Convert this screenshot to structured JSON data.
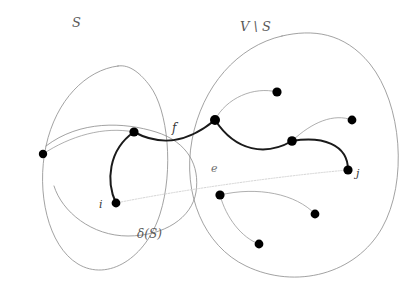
{
  "figure": {
    "background_color": "#ffffff",
    "width": 415,
    "height": 286
  },
  "labels": {
    "set_s": "S",
    "set_v_minus_s": "V \\ S",
    "edge_f": "f",
    "edge_e": "e",
    "node_i": "i",
    "node_j": "j",
    "cut_delta_s": "δ(S)"
  },
  "colors": {
    "blob_outline": "#8a8a8a",
    "thin_edge": "#9a9a9a",
    "faint_edge": "#cfcfcf",
    "thick_path": "#1a1a1a",
    "node_fill": "#000000",
    "label_text": "#5a5a5a"
  },
  "chart_data": {
    "type": "diagram",
    "regions": [
      {
        "name": "S",
        "label": "S",
        "label_pos": [
          78,
          23
        ],
        "path": "M 118 66 C 86 70 56 100 46 146 C 36 192 48 246 78 264 C 108 282 146 258 160 214 C 174 170 168 110 150 86 C 141 74 130 64 118 66 Z"
      },
      {
        "name": "V_minus_S",
        "label": "V \\ S",
        "label_pos": [
          263,
          27
        ],
        "path": "M 282 36 C 238 46 202 86 192 140 C 182 194 204 246 246 266 C 296 290 356 274 382 228 C 408 182 402 104 370 64 C 344 32 312 29 282 36 Z"
      },
      {
        "name": "delta_S_inner_left",
        "label": "δ(S)",
        "label_pos": [
          158,
          236
        ],
        "path": "M 46 146 C 80 120 124 122 156 132 C 188 142 200 166 196 192 C 192 218 164 236 128 236 C 92 236 62 212 54 186"
      }
    ],
    "nodes": [
      {
        "id": "n1",
        "x": 43,
        "y": 154,
        "r": 4.2,
        "label": null,
        "side": "S"
      },
      {
        "id": "n2",
        "x": 134,
        "y": 132,
        "r": 4.6,
        "label": null,
        "side": "S"
      },
      {
        "id": "i",
        "x": 116,
        "y": 203,
        "r": 4.4,
        "label": "i",
        "side": "S"
      },
      {
        "id": "n4",
        "x": 215,
        "y": 120,
        "r": 5.0,
        "label": null,
        "side": "V\\S"
      },
      {
        "id": "n5",
        "x": 277,
        "y": 92,
        "r": 4.6,
        "label": null,
        "side": "V\\S"
      },
      {
        "id": "n6",
        "x": 292,
        "y": 141,
        "r": 4.8,
        "label": null,
        "side": "V\\S"
      },
      {
        "id": "n7",
        "x": 352,
        "y": 120,
        "r": 4.4,
        "label": null,
        "side": "V\\S"
      },
      {
        "id": "j",
        "x": 348,
        "y": 170,
        "r": 4.6,
        "label": "j",
        "side": "V\\S"
      },
      {
        "id": "n9",
        "x": 220,
        "y": 195,
        "r": 4.6,
        "label": null,
        "side": "V\\S"
      },
      {
        "id": "n10",
        "x": 315,
        "y": 214,
        "r": 4.4,
        "label": null,
        "side": "V\\S"
      },
      {
        "id": "n11",
        "x": 259,
        "y": 244,
        "r": 4.4,
        "label": null,
        "side": "V\\S"
      }
    ],
    "edges": [
      {
        "id": "e_thick_i_n2",
        "from": "i",
        "to": "n2",
        "style": "thick",
        "label": null,
        "path": "M 116 203 C 106 182 108 150 134 132"
      },
      {
        "id": "e_thick_f",
        "from": "n2",
        "to": "n4",
        "style": "thick",
        "label": "f",
        "label_pos": [
          176,
          130
        ],
        "path": "M 134 132 C 160 146 186 144 215 120"
      },
      {
        "id": "e_thick_n4_n6",
        "from": "n4",
        "to": "n6",
        "style": "thick",
        "label": null,
        "path": "M 215 120 C 236 152 266 156 292 141"
      },
      {
        "id": "e_thick_n6_j",
        "from": "n6",
        "to": "j",
        "style": "thick",
        "label": null,
        "path": "M 292 141 C 322 136 348 144 348 170"
      },
      {
        "id": "e_thin_n1_n2",
        "from": "n1",
        "to": "n2",
        "style": "thin",
        "label": null,
        "path": "M 43 154 C 70 136 104 126 134 132"
      },
      {
        "id": "e_thin_n4_n5",
        "from": "n4",
        "to": "n5",
        "style": "thin",
        "label": null,
        "path": "M 215 120 C 226 98 254 86 277 92"
      },
      {
        "id": "e_thin_n6_n7",
        "from": "n6",
        "to": "n7",
        "style": "thin",
        "label": null,
        "path": "M 292 141 C 312 122 334 113 352 120"
      },
      {
        "id": "e_faint_e",
        "from": "i",
        "to": "j",
        "style": "faint-dotted",
        "label": "e",
        "label_pos": [
          216,
          170
        ],
        "path": "M 116 203 C 180 190 280 176 348 170"
      },
      {
        "id": "e_thin_n9_n10",
        "from": "n9",
        "to": "n10",
        "style": "thin",
        "label": null,
        "path": "M 220 195 C 258 186 296 194 315 214"
      },
      {
        "id": "e_thin_n9_n11",
        "from": "n9",
        "to": "n11",
        "style": "thin",
        "label": null,
        "path": "M 220 195 C 226 218 242 238 259 244"
      }
    ],
    "title": "",
    "legend": []
  }
}
